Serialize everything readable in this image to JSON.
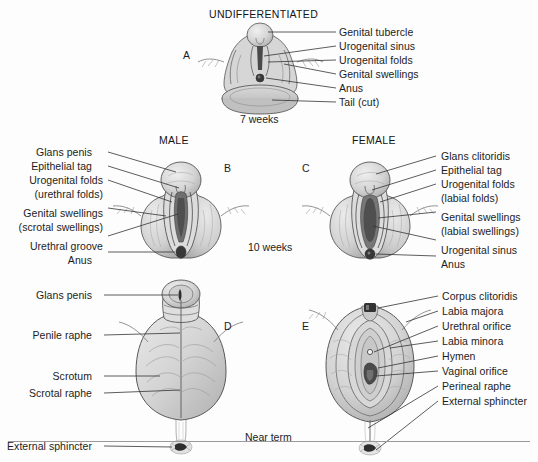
{
  "figure": {
    "title_a": "UNDIFFERENTIATED",
    "title_b": "MALE",
    "title_c": "FEMALE",
    "stages": {
      "seven_weeks": "7 weeks",
      "ten_weeks": "10 weeks",
      "near_term": "Near term"
    },
    "panel_letters": {
      "a": "A",
      "b": "B",
      "c": "C",
      "d": "D",
      "e": "E"
    },
    "colors": {
      "line": "#4a4a4a",
      "fill_light": "#dcdcdc",
      "fill_mid": "#c4c4c4",
      "fill_dark": "#8e8e8e",
      "orifice": "#3a3a3a",
      "text": "#1c1c1c",
      "background": "#fdfdfd"
    }
  },
  "panel_a": {
    "labels": [
      "Genital tubercle",
      "Urogenital sinus",
      "Urogenital folds",
      "Genital swellings",
      "Anus",
      "Tail (cut)"
    ]
  },
  "panel_b": {
    "labels": [
      "Glans penis",
      "Epithelial tag",
      "Urogenital folds",
      "(urethral folds)",
      "Genital swellings",
      "(scrotal swellings)",
      "Urethral groove",
      "Anus"
    ]
  },
  "panel_c": {
    "labels": [
      "Glans clitoridis",
      "Epithelial tag",
      "Urogenital folds",
      "(labial folds)",
      "Genital swellings",
      "(labial swellings)",
      "Urogenital sinus",
      "Anus"
    ]
  },
  "panel_d": {
    "labels": [
      "Glans penis",
      "Penile raphe",
      "Scrotum",
      "Scrotal raphe",
      "External sphincter"
    ]
  },
  "panel_e": {
    "labels": [
      "Corpus clitoridis",
      "Labia majora",
      "Urethral orifice",
      "Labia minora",
      "Hymen",
      "Vaginal orifice",
      "Perineal raphe",
      "External sphincter"
    ]
  }
}
